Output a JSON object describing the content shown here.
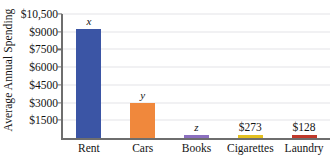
{
  "chart_data": {
    "type": "bar",
    "title": "",
    "xlabel": "",
    "ylabel": "Average Annual Spending",
    "categories": [
      "Rent",
      "Cars",
      "Books",
      "Cigarettes",
      "Laundry"
    ],
    "values": [
      9200,
      3000,
      200,
      273,
      128
    ],
    "data_labels": [
      "x",
      "y",
      "z",
      "$273",
      "$128"
    ],
    "data_label_kinds": [
      "variable",
      "variable",
      "variable",
      "value",
      "value"
    ],
    "bar_colors": [
      "#3B55A5",
      "#F0883C",
      "#8B6FBF",
      "#E3C020",
      "#C0392B"
    ],
    "ylim": [
      0,
      10500
    ],
    "ytick_values": [
      1500,
      3000,
      4500,
      6000,
      7500,
      9000,
      10500
    ],
    "ytick_labels": [
      "$1500",
      "$3000",
      "$4500",
      "$6000",
      "$7500",
      "$9000",
      "$10,500"
    ],
    "grid": true,
    "grid_orientation": "horizontal",
    "legend": "none",
    "axis_color": "#6E6E6E",
    "gridline_color": "#E3E4E8",
    "background_color": "#FFFFFF"
  }
}
